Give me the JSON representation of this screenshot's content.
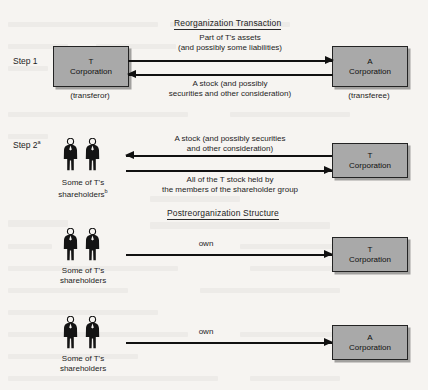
{
  "figure": {
    "section_titles": {
      "reorg": "Reorganization Transaction",
      "post": "Postreorganization Structure"
    },
    "steps": [
      {
        "label": "Step 1",
        "sup": ""
      },
      {
        "label": "Step 2",
        "sup": "a"
      }
    ],
    "boxes": {
      "t_corp_letter": "T",
      "t_corp_word": "Corporation",
      "a_corp_letter": "A",
      "a_corp_word": "Corporation"
    },
    "annotations": {
      "transferor": "(transferor)",
      "transferee": "(transferee)"
    },
    "arrow_labels": {
      "step1_top_line1": "Part of T's assets",
      "step1_top_line2": "(and possibly some liabilities)",
      "step1_bottom_line1": "A stock (and possibly",
      "step1_bottom_line2": "securities and other consideration)",
      "step2_top_line1": "A stock (and possibly securities",
      "step2_top_line2": "and other consideration)",
      "step2_bottom_line1": "All of the T stock held by",
      "step2_bottom_line2": "the members of the shareholder group",
      "own": "own"
    },
    "shareholder_captions": [
      {
        "line1": "Some of T's",
        "line2": "shareholders",
        "sup": "b"
      },
      {
        "line1": "Some of T's",
        "line2": "shareholders",
        "sup": ""
      },
      {
        "line1": "Some of T's",
        "line2": "shareholders",
        "sup": ""
      }
    ],
    "colors": {
      "page_background": "#f6f4f1",
      "box_fill": "#a9a9a9",
      "box_border": "#232323",
      "ink": "#1a1a1a"
    }
  }
}
